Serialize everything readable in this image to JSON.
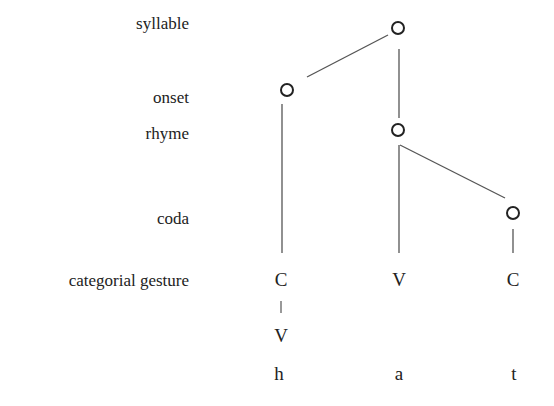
{
  "tiers": {
    "syllable": "syllable",
    "onset": "onset",
    "rhyme": "rhyme",
    "coda": "coda",
    "categorial_gesture": "categorial gesture"
  },
  "gestures": {
    "col1_top": "C",
    "col1_bottom": "V",
    "col2": "V",
    "col3": "C"
  },
  "segments": [
    "h",
    "a",
    "t"
  ],
  "colors": {
    "line": "#555555",
    "node": "#222222",
    "text": "#222222"
  }
}
